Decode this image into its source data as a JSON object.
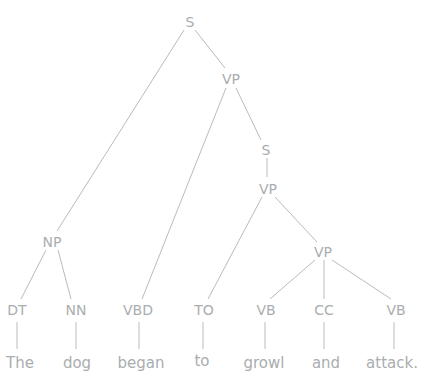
{
  "figure": {
    "type": "constituency-parse-tree",
    "sentence": "The dog began to growl and attack."
  },
  "colors": {
    "background": "#ffffff",
    "line": "#b9bcbc",
    "text": "#a9adaf"
  },
  "parse_tree": {
    "label": "S",
    "children": [
      {
        "label": "NP",
        "children": [
          {
            "label": "DT",
            "children": [
              {
                "label": "The"
              }
            ]
          },
          {
            "label": "NN",
            "children": [
              {
                "label": "dog"
              }
            ]
          }
        ]
      },
      {
        "label": "VP",
        "children": [
          {
            "label": "VBD",
            "children": [
              {
                "label": "began"
              }
            ]
          },
          {
            "label": "S",
            "children": [
              {
                "label": "VP",
                "children": [
                  {
                    "label": "TO",
                    "children": [
                      {
                        "label": "to"
                      }
                    ]
                  },
                  {
                    "label": "VP",
                    "children": [
                      {
                        "label": "VB",
                        "children": [
                          {
                            "label": "growl"
                          }
                        ]
                      },
                      {
                        "label": "CC",
                        "children": [
                          {
                            "label": "and"
                          }
                        ]
                      },
                      {
                        "label": "VB",
                        "children": [
                          {
                            "label": "attack."
                          }
                        ]
                      }
                    ]
                  }
                ]
              }
            ]
          }
        ]
      }
    ]
  }
}
